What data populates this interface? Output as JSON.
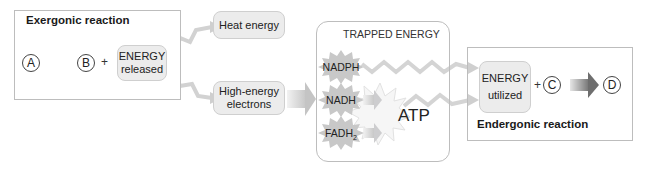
{
  "exergonic": {
    "title": "Exergonic reaction",
    "reactant": "A",
    "product": "B",
    "plus": "+",
    "energy_released": [
      "ENERGY",
      "released"
    ]
  },
  "outputs": {
    "heat": "Heat energy",
    "electrons": [
      "High-energy",
      "electrons"
    ]
  },
  "trapped": {
    "title": "TRAPPED ENERGY",
    "carriers": [
      "NADPH",
      "NADH",
      "FADH"
    ],
    "fadh_subscript": "2",
    "atp": "ATP"
  },
  "endergonic": {
    "title": "Endergonic reaction",
    "energy_utilized": [
      "ENERGY",
      "utilized"
    ],
    "plus": "+",
    "reactant": "C",
    "product": "D"
  },
  "colors": {
    "box_border": "#bdbdbd",
    "pill_fill": "#ececec",
    "arrow_dark": "#7a7a7a",
    "arrow_light": "#d8d8d8",
    "burst_fill": "#c9c9c9"
  }
}
